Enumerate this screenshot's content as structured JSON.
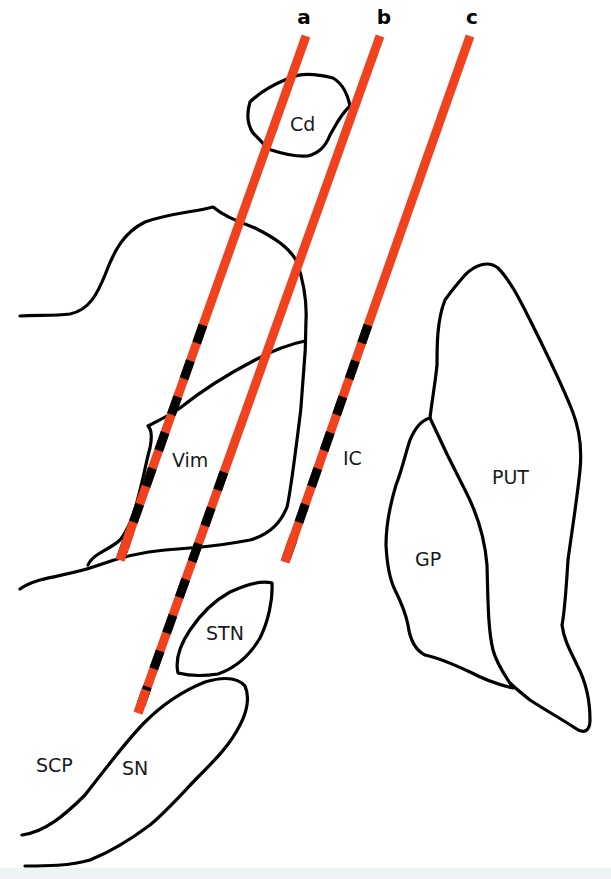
{
  "diagram": {
    "type": "anatomical-schematic",
    "colors": {
      "trajectory": "#f0421e",
      "trajectory_dash": "#000000",
      "outline": "#000000",
      "background": "#ffffff"
    },
    "trajectories": [
      {
        "id": "a",
        "label": "a"
      },
      {
        "id": "b",
        "label": "b"
      },
      {
        "id": "c",
        "label": "c"
      }
    ],
    "regions": [
      {
        "id": "cd",
        "label": "Cd"
      },
      {
        "id": "vim",
        "label": "Vim"
      },
      {
        "id": "ic",
        "label": "IC"
      },
      {
        "id": "put",
        "label": "PUT"
      },
      {
        "id": "gp",
        "label": "GP"
      },
      {
        "id": "stn",
        "label": "STN"
      },
      {
        "id": "scp",
        "label": "SCP"
      },
      {
        "id": "sn",
        "label": "SN"
      }
    ]
  }
}
